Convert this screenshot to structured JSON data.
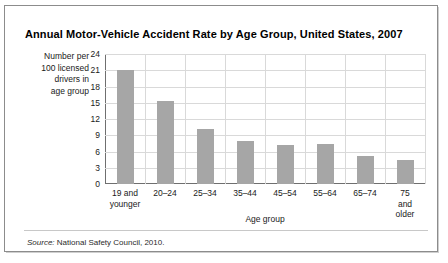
{
  "title": "Annual Motor-Vehicle Accident Rate by Age Group, United States, 2007",
  "y_caption_lines": [
    "Number per",
    "100 licensed",
    "drivers in",
    "age group"
  ],
  "source": {
    "label": "Source:",
    "text": " National Safety Council, 2010."
  },
  "colors": {
    "bar": "#a6a6a6",
    "gridline": "#d9d9d9",
    "axis": "#6f6f6f",
    "frame": "#8c8c8c",
    "text": "#1a1a1a"
  },
  "chart_data": {
    "type": "bar",
    "title": "Annual Motor-Vehicle Accident Rate by Age Group, United States, 2007",
    "xlabel": "Age group",
    "ylabel": "Number per 100 licensed drivers in age group",
    "categories": [
      "19 and\nyounger",
      "20–24",
      "25–34",
      "35–44",
      "45–54",
      "55–64",
      "65–74",
      "75 and\nolder"
    ],
    "values": [
      21.0,
      15.3,
      10.2,
      8.0,
      7.2,
      7.3,
      5.2,
      4.5
    ],
    "ylim": [
      0,
      24
    ],
    "yticks": [
      0,
      3,
      6,
      9,
      12,
      15,
      18,
      21,
      24
    ],
    "grid": true,
    "legend": "none"
  }
}
